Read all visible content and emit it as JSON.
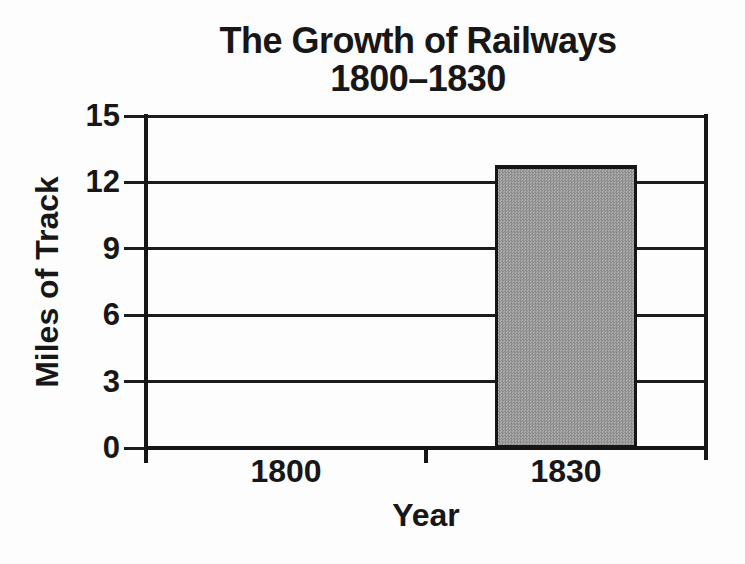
{
  "page": {
    "background": "#fdfdfd"
  },
  "chart": {
    "title_line1": "The Growth of Railways",
    "title_line2": "1800–1830",
    "ylabel": "Miles of Track",
    "xlabel": "Year",
    "colors": {
      "bar_fill": "#9a9a9a",
      "bar_fill_dark": "#8d8d8d",
      "bar_fill_light": "#a9a9a9",
      "line": "#1c1c1c",
      "text": "#171717"
    }
  },
  "chart_data": {
    "type": "bar",
    "title": "The Growth of Railways 1800–1830",
    "categories": [
      "1800",
      "1830"
    ],
    "values": [
      0,
      12.8
    ],
    "xlabel": "Year",
    "ylabel": "Miles of Track",
    "ylim": [
      0,
      15
    ],
    "yticks": [
      0,
      3,
      6,
      9,
      12,
      15
    ],
    "grid": true,
    "legend": false,
    "bar_color": "#9a9a9a"
  }
}
